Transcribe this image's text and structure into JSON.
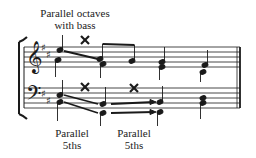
{
  "annotations": {
    "top_label_line1": "Parallel octaves",
    "top_label_line2": "with bass",
    "bottom_label_1_line1": "Parallel",
    "bottom_label_1_line2": "5ths",
    "bottom_label_2_line1": "Parallel",
    "bottom_label_2_line2": "5ths"
  },
  "music": {
    "key_signature": "two sharps (F#, C#)",
    "clefs": [
      "treble-clef",
      "bass-clef"
    ],
    "error_mark": "x-mark",
    "ink_color": "#1a1a1a"
  }
}
